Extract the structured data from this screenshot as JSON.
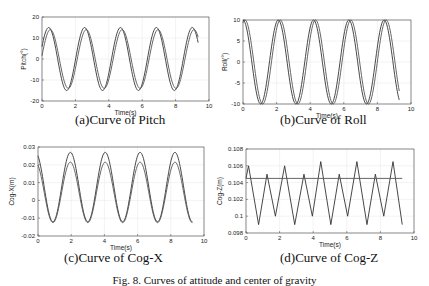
{
  "figure_caption": "Fig. 8. Curves of attitude and center of gravity",
  "chart_data": [
    {
      "id": "pitch",
      "type": "line",
      "caption": "(a)Curve of Pitch",
      "title": "",
      "xlabel": "Time(s)",
      "ylabel": "Pitch(°)",
      "xlim": [
        0,
        10
      ],
      "ylim": [
        -20,
        20
      ],
      "xticks": [
        0,
        2,
        4,
        6,
        8,
        10
      ],
      "yticks": [
        -20,
        -10,
        0,
        10,
        20
      ],
      "grid": true,
      "legend": "none",
      "box": {
        "left": 42,
        "top": 17,
        "right": 209,
        "bottom": 101
      },
      "caption_pos": {
        "x": 75,
        "y": 114
      },
      "series": [
        {
          "name": "curve 1",
          "kind": "sine",
          "amp": 15,
          "offset": 0,
          "period": 2.15,
          "peak_t": 0.4,
          "t0": 0,
          "t1": 9.35,
          "color": "#333"
        },
        {
          "name": "curve 2",
          "kind": "sine",
          "amp": 14,
          "offset": 0,
          "period": 2.15,
          "peak_t": 0.5,
          "t0": 0,
          "t1": 9.35,
          "color": "#555"
        }
      ]
    },
    {
      "id": "roll",
      "type": "line",
      "caption": "(b)Curve of Roll",
      "title": "",
      "xlabel": "Time(s)",
      "ylabel": "Roll(°)",
      "xlim": [
        0,
        10
      ],
      "ylim": [
        -10,
        10
      ],
      "xticks": [
        0,
        2,
        4,
        6,
        8,
        10
      ],
      "yticks": [
        -10,
        -5,
        0,
        5,
        10
      ],
      "grid": true,
      "legend": "none",
      "box": {
        "left": 243,
        "top": 20,
        "right": 411,
        "bottom": 104
      },
      "caption_pos": {
        "x": 280,
        "y": 114
      },
      "series": [
        {
          "name": "curve 1",
          "kind": "sine",
          "amp": 10,
          "offset": 0,
          "period": 2.1,
          "peak_t": 0.0,
          "t0": 0,
          "t1": 9.3,
          "color": "#333"
        },
        {
          "name": "curve 2",
          "kind": "sine",
          "amp": 10,
          "offset": 0,
          "period": 2.1,
          "peak_t": 0.12,
          "t0": 0,
          "t1": 9.3,
          "color": "#555"
        }
      ]
    },
    {
      "id": "cogx",
      "type": "line",
      "caption": "(c)Curve of Cog-X",
      "title": "",
      "xlabel": "Time(s)",
      "ylabel": "Cog-X(m)",
      "xlim": [
        0,
        10
      ],
      "ylim": [
        -0.02,
        0.03
      ],
      "xticks": [
        0,
        2,
        4,
        6,
        8,
        10
      ],
      "yticks": [
        -0.02,
        -0.01,
        0,
        0.01,
        0.02,
        0.03
      ],
      "ytick_labels": [
        "-0.02",
        "-0.01",
        "0",
        "0.01",
        "0.02",
        "0.03"
      ],
      "grid": true,
      "legend": "none",
      "box": {
        "left": 38,
        "top": 147,
        "right": 204,
        "bottom": 236
      },
      "caption_pos": {
        "x": 64,
        "y": 252
      },
      "series": [
        {
          "name": "curve 1",
          "kind": "sine",
          "amp": 0.0195,
          "offset": 0.0075,
          "period": 2.1,
          "peak_t": 1.95,
          "t0": 0,
          "t1": 9.3,
          "color": "#333"
        },
        {
          "name": "curve 2",
          "kind": "sine",
          "amp": 0.017,
          "offset": 0.0045,
          "period": 2.1,
          "peak_t": 1.95,
          "t0": 0,
          "t1": 9.3,
          "color": "#555"
        }
      ]
    },
    {
      "id": "cogz",
      "type": "line",
      "caption": "(d)Curve of Cog-Z",
      "title": "",
      "xlabel": "Time(s)",
      "ylabel": "Cog-Z(m)",
      "xlim": [
        0,
        10
      ],
      "ylim": [
        0.098,
        0.108
      ],
      "xticks": [
        0,
        2,
        4,
        6,
        8,
        10
      ],
      "yticks": [
        0.098,
        0.1,
        0.102,
        0.104,
        0.106,
        0.108
      ],
      "ytick_labels": [
        "0.098",
        "0.1",
        "0.102",
        "0.104",
        "0.106",
        "0.108"
      ],
      "grid": true,
      "legend": "none",
      "box": {
        "left": 246,
        "top": 149,
        "right": 414,
        "bottom": 233
      },
      "caption_pos": {
        "x": 280,
        "y": 252
      },
      "series": [
        {
          "name": "curve 1",
          "kind": "points",
          "color": "#333",
          "x": [
            0,
            0.15,
            0.75,
            1.25,
            1.75,
            2.3,
            2.9,
            3.45,
            3.95,
            4.45,
            5.05,
            5.55,
            6.05,
            6.6,
            7.2,
            7.7,
            8.2,
            8.75,
            9.3
          ],
          "y": [
            0.1045,
            0.106,
            0.099,
            0.105,
            0.1,
            0.106,
            0.099,
            0.105,
            0.1,
            0.1065,
            0.099,
            0.105,
            0.1,
            0.1065,
            0.099,
            0.105,
            0.1,
            0.1065,
            0.099
          ]
        },
        {
          "name": "curve 2",
          "kind": "points",
          "color": "#555",
          "x": [
            0,
            9.3
          ],
          "y": [
            0.1045,
            0.1045
          ]
        }
      ]
    }
  ]
}
